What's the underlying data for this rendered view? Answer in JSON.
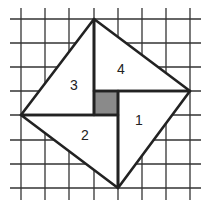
{
  "diagram": {
    "grid": {
      "x_lines": [
        21,
        45,
        69,
        94,
        118,
        142,
        166,
        190
      ],
      "y_lines": [
        19,
        43,
        67,
        91,
        115,
        140,
        164,
        188
      ],
      "x_extent": [
        10,
        201
      ],
      "y_extent": [
        8,
        200
      ],
      "color": "#333333"
    },
    "outer_square": {
      "vertices": [
        [
          94,
          19
        ],
        [
          190,
          91
        ],
        [
          118,
          188
        ],
        [
          21,
          115
        ]
      ]
    },
    "center_square": {
      "x": 94,
      "y": 91,
      "width": 24,
      "height": 24,
      "fill": "#8a8a8a"
    },
    "triangles": [
      {
        "label": "1",
        "points": [
          [
            190,
            91
          ],
          [
            118,
            188
          ],
          [
            118,
            91
          ]
        ],
        "label_pos": [
          139,
          121
        ]
      },
      {
        "label": "2",
        "points": [
          [
            118,
            188
          ],
          [
            21,
            115
          ],
          [
            118,
            115
          ]
        ],
        "label_pos": [
          85,
          136
        ]
      },
      {
        "label": "3",
        "points": [
          [
            21,
            115
          ],
          [
            94,
            19
          ],
          [
            94,
            115
          ]
        ],
        "label_pos": [
          74,
          86
        ]
      },
      {
        "label": "4",
        "points": [
          [
            94,
            19
          ],
          [
            190,
            91
          ],
          [
            94,
            91
          ]
        ],
        "label_pos": [
          121,
          70
        ]
      }
    ],
    "outline_color": "#222222"
  }
}
